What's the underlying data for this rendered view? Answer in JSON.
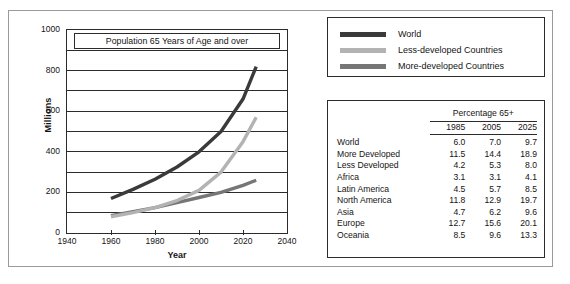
{
  "chart_data": {
    "type": "line",
    "title": "Population 65 Years of Age and over",
    "xlabel": "Year",
    "ylabel": "Millions",
    "xlim": [
      1940,
      2040
    ],
    "ylim": [
      0,
      1000
    ],
    "xticks": [
      1940,
      1960,
      1980,
      2000,
      2020,
      2040
    ],
    "yticks": [
      0,
      200,
      400,
      600,
      800,
      1000
    ],
    "gridlines_every": 100,
    "grid": true,
    "legend_position": "outside-top-right",
    "series": [
      {
        "name": "World",
        "color": "#3a3a3a",
        "x": [
          1960,
          1970,
          1980,
          1990,
          2000,
          2010,
          2020,
          2026
        ],
        "values": [
          170,
          215,
          265,
          325,
          400,
          500,
          660,
          820
        ]
      },
      {
        "name": "Less-developed Countries",
        "color": "#b3b3b3",
        "x": [
          1960,
          1970,
          1980,
          1990,
          2000,
          2010,
          2020,
          2026
        ],
        "values": [
          80,
          100,
          125,
          160,
          210,
          300,
          450,
          570
        ]
      },
      {
        "name": "More-developed Countries",
        "color": "#767676",
        "x": [
          1960,
          1970,
          1980,
          1990,
          2000,
          2010,
          2020,
          2026
        ],
        "values": [
          85,
          105,
          125,
          150,
          175,
          200,
          235,
          260
        ]
      }
    ]
  },
  "chart": {
    "title": "Population 65 Years of Age and over",
    "y_axis_title": "Millions",
    "x_axis_title": "Year",
    "y_tick_labels": [
      "1000",
      "800",
      "600",
      "400",
      "200",
      "0"
    ],
    "x_tick_labels": [
      "1940",
      "1960",
      "1980",
      "2000",
      "2020",
      "2040"
    ]
  },
  "legend": {
    "items": [
      {
        "label": "World",
        "color": "#3a3a3a"
      },
      {
        "label": "Less-developed Countries",
        "color": "#b3b3b3"
      },
      {
        "label": "More-developed Countries",
        "color": "#767676"
      }
    ]
  },
  "table": {
    "span_header": "Percentage 65+",
    "column_headers": [
      "1985",
      "2005",
      "2025"
    ],
    "rows": [
      {
        "region": "World",
        "v1985": "6.0",
        "v2005": "7.0",
        "v2025": "9.7"
      },
      {
        "region": "More Developed",
        "v1985": "11.5",
        "v2005": "14.4",
        "v2025": "18.9"
      },
      {
        "region": "Less Developed",
        "v1985": "4.2",
        "v2005": "5.3",
        "v2025": "8.0"
      },
      {
        "region": "Africa",
        "v1985": "3.1",
        "v2005": "3.1",
        "v2025": "4.1"
      },
      {
        "region": "Latin America",
        "v1985": "4.5",
        "v2005": "5.7",
        "v2025": "8.5"
      },
      {
        "region": "North America",
        "v1985": "11.8",
        "v2005": "12.9",
        "v2025": "19.7"
      },
      {
        "region": "Asia",
        "v1985": "4.7",
        "v2005": "6.2",
        "v2025": "9.6"
      },
      {
        "region": "Europe",
        "v1985": "12.7",
        "v2005": "15.6",
        "v2025": "20.1"
      },
      {
        "region": "Oceania",
        "v1985": "8.5",
        "v2005": "9.6",
        "v2025": "13.3"
      }
    ]
  }
}
